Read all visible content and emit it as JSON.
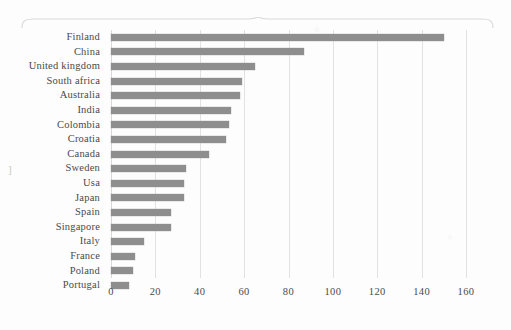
{
  "chart_data": {
    "type": "bar",
    "orientation": "horizontal",
    "title": "",
    "xlabel": "",
    "ylabel": "",
    "xlim": [
      0,
      160
    ],
    "xticks": [
      0,
      20,
      40,
      60,
      80,
      100,
      120,
      140,
      160
    ],
    "grid": true,
    "legend": false,
    "bar_color": "#8e8e8e",
    "categories": [
      "Finland",
      "China",
      "United kingdom",
      "South africa",
      "Australia",
      "India",
      "Colombia",
      "Croatia",
      "Canada",
      "Sweden",
      "Usa",
      "Japan",
      "Spain",
      "Singapore",
      "Italy",
      "France",
      "Poland",
      "Portugal"
    ],
    "values": [
      150,
      87,
      65,
      59,
      58,
      54,
      53,
      52,
      44,
      34,
      33,
      33,
      27,
      27,
      15,
      11,
      10,
      8
    ]
  },
  "artifacts": {
    "left_bracket": "]",
    "top_mark": ""
  }
}
